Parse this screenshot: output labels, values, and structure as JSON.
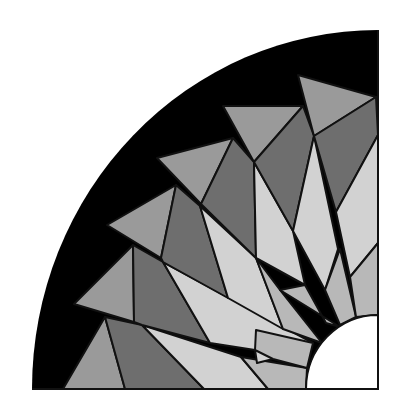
{
  "colors": {
    "background": "#ffffff",
    "outer_band": "#000000",
    "medium": "#9a9a9a",
    "dark": "#6e6e6e",
    "light": "#d2d2d2",
    "inner_light": "#b8b8b8",
    "stroke": "#111111"
  },
  "geometry": {
    "center": [
      378,
      389
    ],
    "outer_radius_x": 346,
    "outer_radius_y": 359,
    "inner_radius": 72
  },
  "pieces": [
    {
      "fill": "medium",
      "points": "63,389 105,317 125,389"
    },
    {
      "fill": "dark",
      "points": "105,317 125,389 204,389 142,325"
    },
    {
      "fill": "light",
      "points": "142,325 204,389 268,389 241,357"
    },
    {
      "fill": "inner_light",
      "points": "241,357 268,389 306,389 307,368"
    },
    {
      "fill": "medium",
      "points": "74,304 133,245 134,322"
    },
    {
      "fill": "dark",
      "points": "133,245 134,322 142,325 210,343 163,262"
    },
    {
      "fill": "light",
      "points": "163,262 210,343 255,350 257,363 273,359 313,343"
    },
    {
      "fill": "inner_light",
      "points": "255,350 273,359 307,368 313,343 256,330"
    },
    {
      "fill": "medium",
      "points": "107,225 176,185 161,258"
    },
    {
      "fill": "dark",
      "points": "176,185 161,258 163,262 228,298 200,206"
    },
    {
      "fill": "light",
      "points": "200,206 228,298 283,329 256,258"
    },
    {
      "fill": "inner_light",
      "points": "256,258 283,329 322,343 280,290"
    },
    {
      "fill": "medium",
      "points": "157,158 233,138 201,204"
    },
    {
      "fill": "dark",
      "points": "233,138 201,204 256,258 254,162"
    },
    {
      "fill": "light",
      "points": "254,162 256,258 305,285 293,231"
    },
    {
      "fill": "inner_light",
      "points": "280,290 305,285 326,323 340,327"
    },
    {
      "fill": "medium",
      "points": "223,106 303,106 254,162"
    },
    {
      "fill": "dark",
      "points": "303,106 254,162 293,231 314,136"
    },
    {
      "fill": "light",
      "points": "314,136 293,231 325,290 338,249"
    },
    {
      "fill": "inner_light",
      "points": "325,290 340,325 356,317 340,249"
    },
    {
      "fill": "medium",
      "points": "298,75 376,97 314,136"
    },
    {
      "fill": "dark",
      "points": "376,97 314,136 336,212 378,135"
    },
    {
      "fill": "light",
      "points": "378,135 336,212 350,277 378,243"
    },
    {
      "fill": "inner_light",
      "points": "350,277 356,317 378,315 378,243"
    }
  ]
}
